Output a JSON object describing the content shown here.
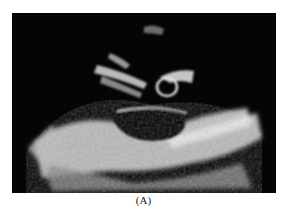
{
  "figure": {
    "caption": "(A)",
    "background_color": "#050505"
  }
}
